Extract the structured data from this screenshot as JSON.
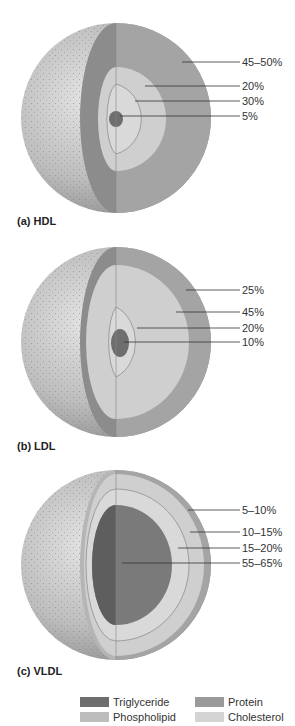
{
  "colors": {
    "triglyceride": "#6e6e6e",
    "protein": "#9a9a9a",
    "phospholipid": "#bdbdbd",
    "cholesterol": "#d4d4d4",
    "surface": "#b0b0b0",
    "leader": "#333333"
  },
  "panels": [
    {
      "caption": "(a)  HDL",
      "labels": [
        "45–50%",
        "20%",
        "30%",
        "5%"
      ]
    },
    {
      "caption": "(b)  LDL",
      "labels": [
        "25%",
        "45%",
        "20%",
        "10%"
      ]
    },
    {
      "caption": "(c)  VLDL",
      "labels": [
        "5–10%",
        "10–15%",
        "15–20%",
        "55–65%"
      ]
    }
  ],
  "legend": [
    {
      "label": "Triglyceride",
      "key": "triglyceride"
    },
    {
      "label": "Protein",
      "key": "protein"
    },
    {
      "label": "Phospholipid",
      "key": "phospholipid"
    },
    {
      "label": "Cholesterol",
      "key": "cholesterol"
    }
  ]
}
